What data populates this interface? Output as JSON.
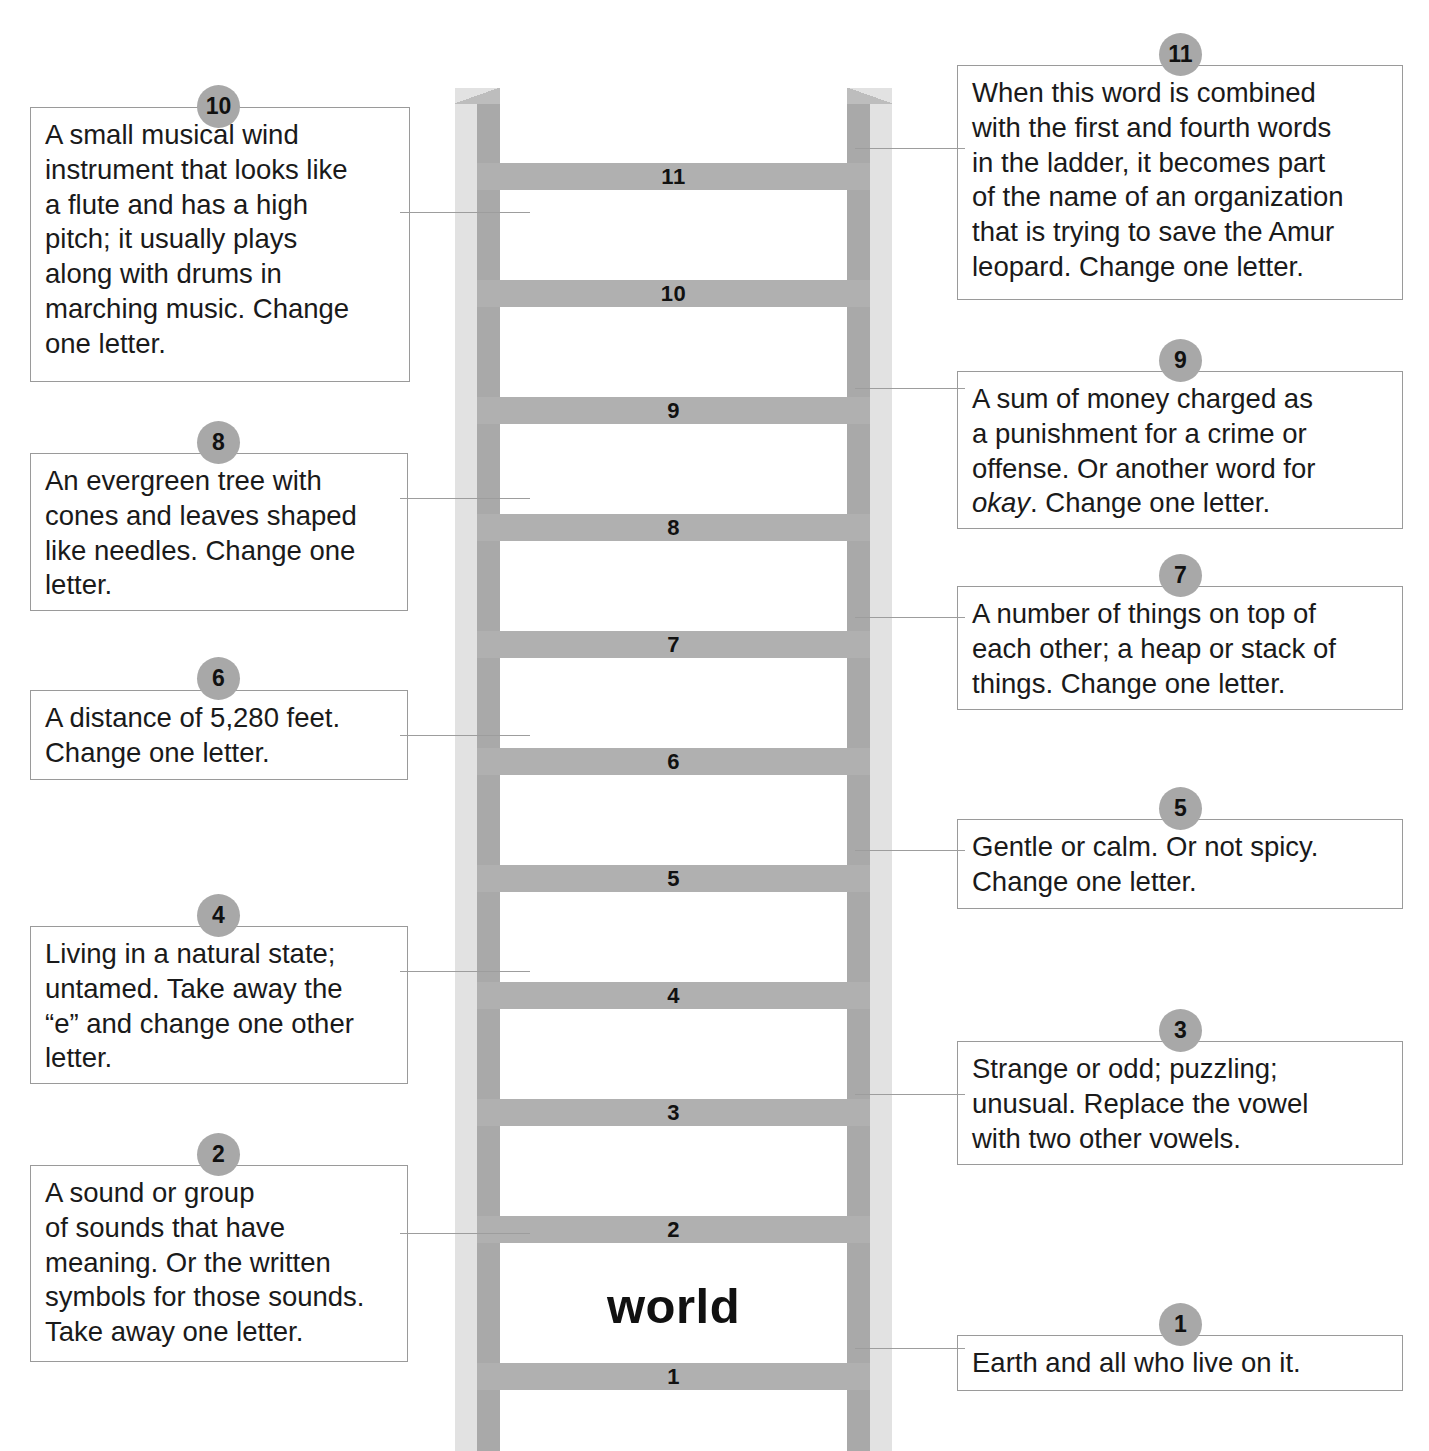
{
  "puzzle": {
    "answer_word": "world",
    "rungs": [
      {
        "number": "1"
      },
      {
        "number": "2"
      },
      {
        "number": "3"
      },
      {
        "number": "4"
      },
      {
        "number": "5"
      },
      {
        "number": "6"
      },
      {
        "number": "7"
      },
      {
        "number": "8"
      },
      {
        "number": "9"
      },
      {
        "number": "10"
      },
      {
        "number": "11"
      }
    ]
  },
  "clues": {
    "c1": {
      "number": "1",
      "text": "Earth and all who live on it."
    },
    "c2": {
      "number": "2",
      "text": "A sound or group\nof sounds that have\nmeaning.  Or the written\nsymbols for those sounds.\nTake away one letter."
    },
    "c3": {
      "number": "3",
      "text": "Strange or odd; puzzling;\nunusual.  Replace the vowel\nwith two other vowels."
    },
    "c4": {
      "number": "4",
      "text": "Living in a natural state;\nuntamed.  Take away the\n“e” and change one other\nletter."
    },
    "c5": {
      "number": "5",
      "text": "Gentle or calm.  Or not spicy.\nChange one letter."
    },
    "c6": {
      "number": "6",
      "text": "A distance of 5,280 feet.\nChange one letter."
    },
    "c7": {
      "number": "7",
      "text": "A number of things on top of\neach other; a heap or stack of\nthings.  Change one letter."
    },
    "c8": {
      "number": "8",
      "text": "An evergreen tree with\ncones and leaves shaped\nlike needles.  Change one\nletter."
    },
    "c9": {
      "number": "9",
      "text_before": "A sum of money charged as\na punishment for a crime or\noffense.  Or another word for\n",
      "text_italic": "okay",
      "text_after": ".  Change one letter."
    },
    "c10": {
      "number": "10",
      "text": "A small musical wind\ninstrument that looks like\na flute and has a high\npitch; it usually plays\nalong with drums in\nmarching music.  Change\none letter."
    },
    "c11": {
      "number": "11",
      "text": "When this word is combined\nwith the first and fourth words\nin the ladder, it becomes part\nof the name of an organization\nthat is trying to save the Amur\nleopard.  Change one letter."
    }
  },
  "colors": {
    "rail_light": "#e2e2e2",
    "rail_dark": "#a9a9a9",
    "rung": "#b0b0b0",
    "badge": "#a8a8a8",
    "box_border": "#9a9a9a",
    "text": "#1a1a1a"
  }
}
